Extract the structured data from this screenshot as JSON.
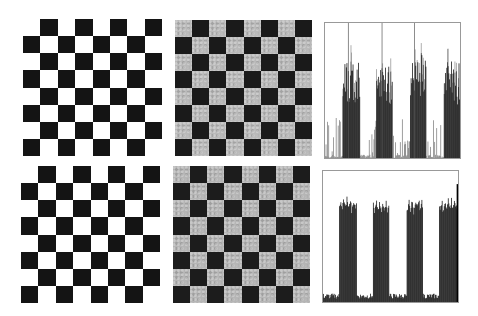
{
  "figure": {
    "panels": [
      {
        "id": "top-clean-board",
        "type": "checkerboard",
        "rows": 8,
        "cols": 8,
        "dark": "#141414",
        "light": "#ffffff",
        "noise": false,
        "start_dark": false,
        "box": [
          23,
          19,
          139,
          137
        ]
      },
      {
        "id": "top-noisy-board",
        "type": "checkerboard",
        "rows": 8,
        "cols": 8,
        "dark": "#1a1a1a",
        "light": "#b9b9b9",
        "noise": true,
        "start_dark": false,
        "box": [
          175,
          20,
          137,
          136
        ]
      },
      {
        "id": "top-histogram",
        "type": "histogram",
        "box": [
          324,
          22,
          137,
          137
        ],
        "style": "noisy"
      },
      {
        "id": "bottom-clean-board",
        "type": "checkerboard",
        "rows": 8,
        "cols": 8,
        "dark": "#141414",
        "light": "#ffffff",
        "noise": false,
        "start_dark": false,
        "box": [
          21,
          166,
          139,
          137
        ]
      },
      {
        "id": "bottom-smoothed-board",
        "type": "checkerboard",
        "rows": 8,
        "cols": 8,
        "dark": "#1c1c1c",
        "light": "#b5b5b5",
        "noise": true,
        "start_dark": false,
        "box": [
          173,
          166,
          137,
          137
        ]
      },
      {
        "id": "bottom-histogram",
        "type": "histogram",
        "box": [
          322,
          170,
          137,
          133
        ],
        "style": "smooth"
      }
    ]
  },
  "chart_data": [
    {
      "type": "bar",
      "title": "",
      "xlabel": "",
      "ylabel": "",
      "description": "Top histogram: column-wise intensity profile of noisy checkerboard; four tall noisy bands with spiky tops and low noisy gaps",
      "bands": [
        {
          "x0": 0.13,
          "x1": 0.26,
          "height": 0.75
        },
        {
          "x0": 0.38,
          "x1": 0.5,
          "height": 0.7
        },
        {
          "x0": 0.63,
          "x1": 0.75,
          "height": 0.78
        },
        {
          "x0": 0.88,
          "x1": 1.0,
          "height": 0.72
        }
      ],
      "gap_level": 0.12,
      "spikes_to_top": [
        0.17,
        0.42,
        0.66
      ]
    },
    {
      "type": "bar",
      "title": "",
      "xlabel": "",
      "ylabel": "",
      "description": "Bottom histogram: smoothed profile; four solid bands with slightly jagged tops, low baseline between",
      "bands": [
        {
          "x0": 0.12,
          "x1": 0.25,
          "height": 0.73
        },
        {
          "x0": 0.37,
          "x1": 0.49,
          "height": 0.71
        },
        {
          "x0": 0.62,
          "x1": 0.74,
          "height": 0.72
        },
        {
          "x0": 0.86,
          "x1": 1.0,
          "height": 0.72
        }
      ],
      "gap_level": 0.05,
      "right_edge_spike": 0.9
    }
  ]
}
